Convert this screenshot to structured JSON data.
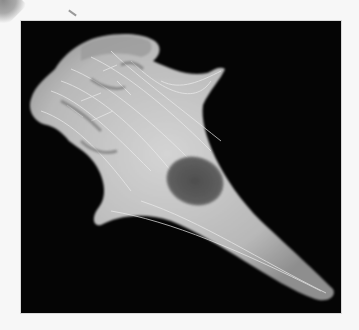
{
  "image": {
    "subject": "fluorescence micrograph of a single cell showing cytoskeletal filaments and nucleus",
    "background_color": "#050505",
    "cell_color": "#c9c9c9",
    "nucleus_color": "#5a5a5a",
    "page_color": "#f7f7f7"
  }
}
